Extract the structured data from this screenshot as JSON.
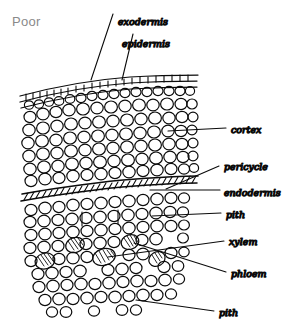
{
  "quality": {
    "label": "Poor"
  },
  "figure": {
    "name": "root-cross-section-sketch",
    "ink_color": "#0b0b0b",
    "background_color": "#ffffff",
    "quality_label_color": "#8a8a8a"
  },
  "labels": [
    {
      "id": "exodermis",
      "text": "exodermis"
    },
    {
      "id": "epidermis",
      "text": "epidermis"
    },
    {
      "id": "cortex",
      "text": "cortex"
    },
    {
      "id": "pericycle",
      "text": "pericycle"
    },
    {
      "id": "endodermis",
      "text": "endodermis"
    },
    {
      "id": "pith-upper",
      "text": "pith"
    },
    {
      "id": "xylem",
      "text": "xylem"
    },
    {
      "id": "phloem",
      "text": "phloem"
    },
    {
      "id": "pith-lower",
      "text": "pith"
    }
  ]
}
